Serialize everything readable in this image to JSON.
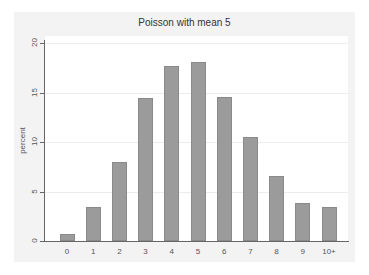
{
  "chart_data": {
    "type": "bar",
    "title": "Poisson with mean 5",
    "xlabel": "",
    "ylabel": "percent",
    "categories": [
      "0",
      "1",
      "2",
      "3",
      "4",
      "5",
      "6",
      "7",
      "8",
      "9",
      "10+"
    ],
    "values": [
      0.7,
      3.4,
      8.0,
      14.4,
      17.7,
      18.1,
      14.5,
      10.5,
      6.6,
      3.8,
      3.4
    ],
    "ylim": [
      0,
      20
    ],
    "yticks": [
      "0",
      "5",
      "10",
      "15",
      "20"
    ],
    "grid": true,
    "legend": null,
    "bar_color": "#9b9b9b"
  }
}
